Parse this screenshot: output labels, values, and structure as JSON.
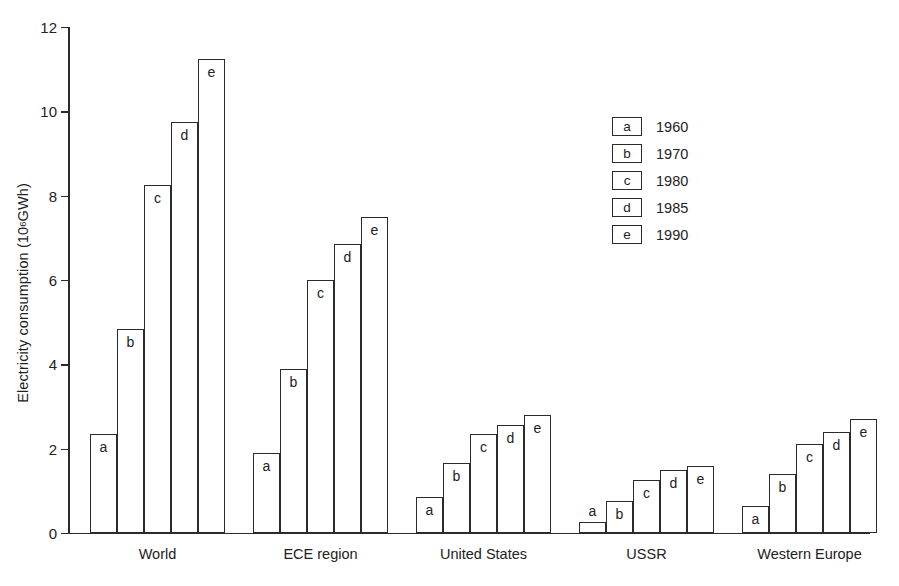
{
  "chart_data": {
    "type": "bar",
    "title": "",
    "subtitle": "",
    "xlabel": "",
    "ylabel": "Electricity consumption (10⁶ GWh)",
    "ylabel_prefix": "Electricity consumption (10",
    "ylabel_exponent": "6",
    "ylabel_suffix": " GWh)",
    "ylim": [
      0,
      12
    ],
    "ytick_labels": [
      "0",
      "2",
      "4",
      "6",
      "8",
      "10",
      "12"
    ],
    "ytick_values": [
      0,
      2,
      4,
      6,
      8,
      10,
      12
    ],
    "grid": false,
    "legend_position": "center-right",
    "categories": [
      "World",
      "ECE region",
      "United States",
      "USSR",
      "Western Europe"
    ],
    "series": [
      {
        "name": "1960",
        "letter": "a",
        "values": [
          2.35,
          1.9,
          0.85,
          0.25,
          0.65
        ]
      },
      {
        "name": "1970",
        "letter": "b",
        "values": [
          4.85,
          3.9,
          1.65,
          0.75,
          1.4
        ]
      },
      {
        "name": "1980",
        "letter": "c",
        "values": [
          8.25,
          6.0,
          2.35,
          1.25,
          2.1
        ]
      },
      {
        "name": "1985",
        "letter": "d",
        "values": [
          9.75,
          6.85,
          2.55,
          1.5,
          2.4
        ]
      },
      {
        "name": "1990",
        "letter": "e",
        "values": [
          11.25,
          7.5,
          2.8,
          1.6,
          2.7
        ]
      }
    ],
    "legend": [
      {
        "letter": "a",
        "label": "1960"
      },
      {
        "letter": "b",
        "label": "1970"
      },
      {
        "letter": "c",
        "label": "1980"
      },
      {
        "letter": "d",
        "label": "1985"
      },
      {
        "letter": "e",
        "label": "1990"
      }
    ],
    "colors": {
      "bar_fill": "#ffffff",
      "bar_outline": "#2b2b2b",
      "axis": "#2b2b2b",
      "text": "#222222",
      "background": "#ffffff"
    }
  }
}
